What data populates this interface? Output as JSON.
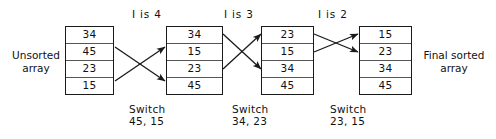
{
  "diagram": {
    "title_left": "Unsorted\narray",
    "title_right": "Final sorted\narray",
    "arrays": [
      {
        "name": "unsorted-array",
        "values": [
          "34",
          "45",
          "23",
          "15"
        ]
      },
      {
        "name": "pass-1-array",
        "values": [
          "34",
          "15",
          "23",
          "45"
        ]
      },
      {
        "name": "pass-2-array",
        "values": [
          "23",
          "15",
          "34",
          "45"
        ]
      },
      {
        "name": "final-sorted-array",
        "values": [
          "15",
          "23",
          "34",
          "45"
        ]
      }
    ],
    "iterations": [
      {
        "label": "I is 4"
      },
      {
        "label": "I is 3"
      },
      {
        "label": "I is 2"
      }
    ],
    "switches": [
      {
        "label": "Switch\n45, 15"
      },
      {
        "label": "Switch\n34, 23"
      },
      {
        "label": "Switch\n23, 15"
      }
    ],
    "colors": {
      "stroke": "#1a1a1a",
      "cell_divider": "#555555",
      "background": "#ffffff",
      "text": "#111111"
    }
  }
}
